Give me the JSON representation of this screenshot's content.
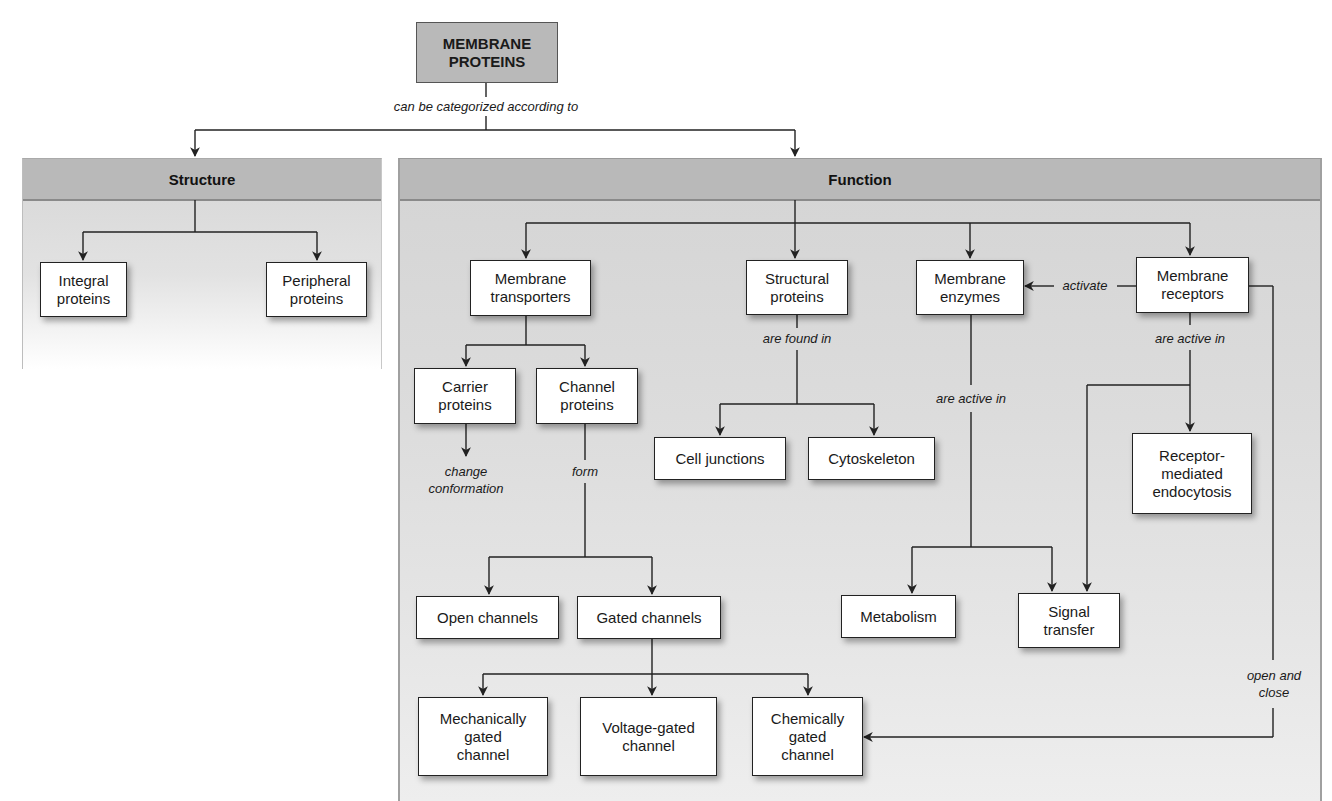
{
  "root": {
    "label": "MEMBRANE\nPROTEINS"
  },
  "root_relation": "can be categorized according to",
  "structure": {
    "header": "Structure",
    "children": [
      "Integral\nproteins",
      "Peripheral\nproteins"
    ]
  },
  "function": {
    "header": "Function",
    "categories": {
      "transporters": "Membrane\ntransporters",
      "structural": "Structural\nproteins",
      "enzymes": "Membrane\nenzymes",
      "receptors": "Membrane\nreceptors"
    },
    "transporters_children": {
      "carrier": "Carrier\nproteins",
      "channel": "Channel\nproteins"
    },
    "carrier_action": "change\nconformation",
    "channel_relation": "form",
    "channel_types": {
      "open": "Open channels",
      "gated": "Gated channels"
    },
    "gated_types": {
      "mechanical": "Mechanically\ngated\nchannel",
      "voltage": "Voltage-gated\nchannel",
      "chemical": "Chemically\ngated\nchannel"
    },
    "structural_relation": "are found in",
    "structural_children": {
      "cell_junctions": "Cell junctions",
      "cytoskeleton": "Cytoskeleton"
    },
    "enzymes_relation": "are active in",
    "enzymes_children": {
      "metabolism": "Metabolism",
      "signal_transfer": "Signal\ntransfer"
    },
    "receptors_activate_relation": "activate",
    "receptors_relation": "are active in",
    "receptors_children": {
      "endocytosis": "Receptor-\nmediated\nendocytosis"
    },
    "receptors_gate_relation": "open and\nclose"
  },
  "colors": {
    "header_fill": "#b9b9b9",
    "panel_fill": "#d8d8d8",
    "node_fill": "#ffffff",
    "line": "#222222"
  }
}
